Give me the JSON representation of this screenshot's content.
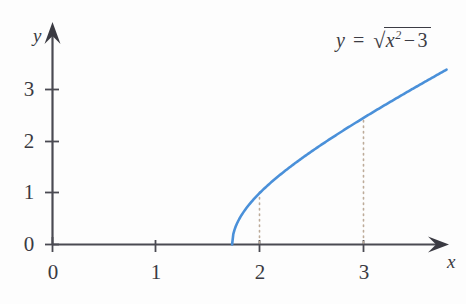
{
  "figure": {
    "background_color": "#fdfdfd",
    "axis_color": "#4a4a52",
    "curve_color": "#4a90d9",
    "dotted_color": "#b9a896",
    "text_color": "#3a3a42"
  },
  "equation": {
    "lhs": "y",
    "equals": "=",
    "radical_sign": "√",
    "radicand_base": "x",
    "radicand_exponent": "2",
    "minus": "−",
    "radicand_constant": "3",
    "full_text": "y = √(x² − 3)"
  },
  "axes": {
    "x_axis_label": "x",
    "y_axis_label": "y",
    "x_ticks": [
      "0",
      "1",
      "2",
      "3"
    ],
    "y_ticks": [
      "0",
      "1",
      "2",
      "3"
    ],
    "x_tick_values": [
      0,
      1,
      2,
      3
    ],
    "y_tick_values": [
      0,
      1,
      2,
      3
    ],
    "origin_label": "0"
  },
  "annotations": {
    "dotted_line_1_x": "2",
    "dotted_line_2_x": "3"
  },
  "chart_data": {
    "type": "line",
    "xlabel": "x",
    "ylabel": "y",
    "xlim": [
      0,
      3.8
    ],
    "ylim": [
      0,
      3.3
    ],
    "grid": false,
    "legend": null,
    "xticks": [
      0,
      1,
      2,
      3
    ],
    "yticks": [
      0,
      1,
      2,
      3
    ],
    "domain_start": 1.732,
    "annotations": [
      {
        "type": "dotted-vertical",
        "x": 2,
        "y_from": 0,
        "y_to": 1.0
      },
      {
        "type": "dotted-vertical",
        "x": 3,
        "y_from": 0,
        "y_to": 2.449
      }
    ],
    "series": [
      {
        "name": "y = sqrt(x^2 - 3)",
        "color": "#4a90d9",
        "x": [
          1.732,
          1.75,
          1.8,
          1.85,
          1.9,
          1.95,
          2.0,
          2.1,
          2.2,
          2.3,
          2.4,
          2.5,
          2.6,
          2.7,
          2.8,
          2.9,
          3.0,
          3.1,
          3.2,
          3.3,
          3.4,
          3.5,
          3.6,
          3.7,
          3.8
        ],
        "y": [
          0.0,
          0.259,
          0.424,
          0.558,
          0.678,
          0.787,
          1.0,
          1.114,
          1.345,
          1.552,
          1.744,
          1.921,
          2.088,
          2.247,
          2.398,
          2.543,
          2.449,
          2.814,
          2.947,
          3.077,
          3.203,
          3.324,
          3.443,
          3.559,
          3.672
        ]
      }
    ],
    "curve_points": [
      {
        "x": 1.732,
        "y": 0.0
      },
      {
        "x": 1.8,
        "y": 0.424
      },
      {
        "x": 1.9,
        "y": 0.678
      },
      {
        "x": 2.0,
        "y": 1.0
      },
      {
        "x": 2.2,
        "y": 1.345
      },
      {
        "x": 2.4,
        "y": 1.744
      },
      {
        "x": 2.6,
        "y": 2.088
      },
      {
        "x": 2.8,
        "y": 2.398
      },
      {
        "x": 3.0,
        "y": 2.449
      },
      {
        "x": 3.2,
        "y": 2.947
      },
      {
        "x": 3.4,
        "y": 3.203
      },
      {
        "x": 3.6,
        "y": 3.443
      },
      {
        "x": 3.8,
        "y": 3.15
      }
    ]
  }
}
